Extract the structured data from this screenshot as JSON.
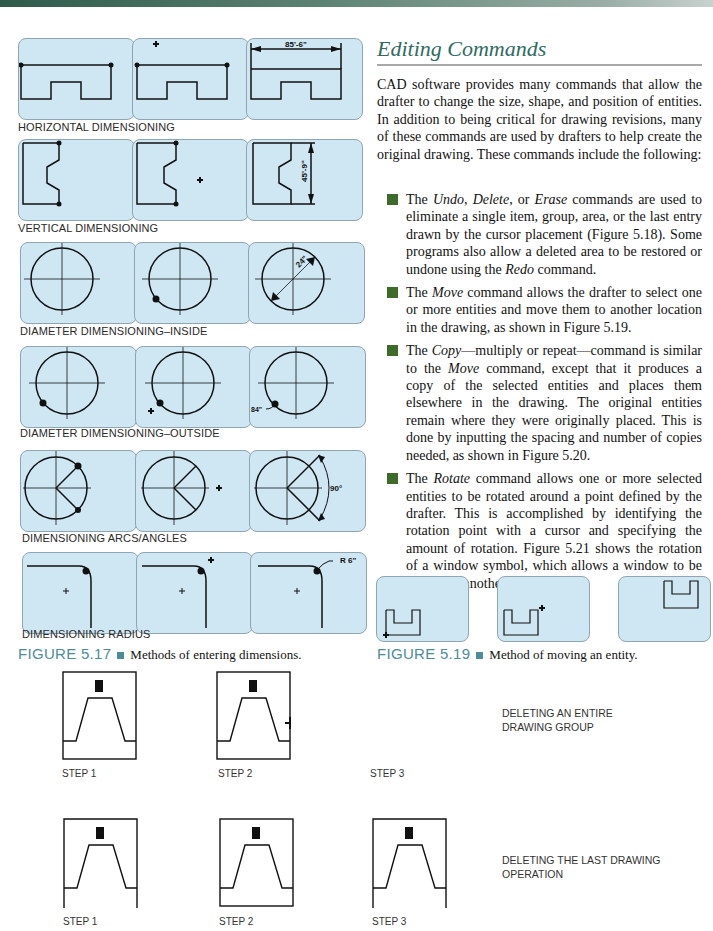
{
  "page": {
    "section_heading": "Editing Commands",
    "intro_paragraph": "CAD software provides many commands that allow the drafter to change the size, shape, and position of entities. In addition to being critical for drawing revisions, many of these commands are used by drafters to help create the original drawing. These commands include the following:",
    "bullets": [
      {
        "parts": [
          "The ",
          "Undo",
          ", ",
          "Delete",
          ", or ",
          "Erase",
          " commands are used to eliminate a single item, group, area, or the last entry drawn by the cursor placement (Figure 5.18). Some programs also allow a deleted area to be restored or undone using the ",
          "Redo",
          " command."
        ]
      },
      {
        "parts": [
          "The ",
          "Move",
          " command allows the drafter to select one or more entities and move them to another location in the drawing, as shown in Figure 5.19."
        ]
      },
      {
        "parts": [
          "The ",
          "Copy",
          "—multiply or repeat—command is similar to the ",
          "Move",
          " command, except that it produces a copy of the selected entities and places them elsewhere in the drawing. The original entities remain where they were originally placed. This is done by inputting the spacing and number of copies needed, as shown in Figure 5.20."
        ]
      },
      {
        "parts": [
          "The ",
          "Rotate",
          " command allows one or more selected entities to be rotated around a point defined by the drafter. This is accomplished by identifying the rotation point with a cursor and specifying the amount of rotation. Figure 5.21 shows the rotation of a window symbol, which allows a window to be placed on another wall."
        ]
      }
    ]
  },
  "figure_5_17": {
    "number": "FIGURE 5.17",
    "caption": "Methods of entering dimensions.",
    "rows": [
      {
        "label": "HORIZONTAL DIMENSIONING",
        "dimension_text": "85'-6\""
      },
      {
        "label": "VERTICAL DIMENSIONING",
        "dimension_text": "45'-9\""
      },
      {
        "label": "DIAMETER DIMENSIONING–INSIDE",
        "dimension_text": "24\""
      },
      {
        "label": "DIAMETER DIMENSIONING–OUTSIDE",
        "dimension_text": "84\""
      },
      {
        "label": "DIMENSIONING ARCS/ANGLES",
        "dimension_text": "90°"
      },
      {
        "label": "DIMENSIONING RADIUS",
        "dimension_text": "R 6\""
      }
    ]
  },
  "figure_5_19": {
    "number": "FIGURE 5.19",
    "caption": "Method of moving an entity."
  },
  "figure_5_18": {
    "rows": [
      {
        "steps": [
          "STEP 1",
          "STEP 2",
          "STEP 3"
        ],
        "description": "DELETING AN ENTIRE DRAWING GROUP"
      },
      {
        "steps": [
          "STEP 1",
          "STEP 2",
          "STEP 3"
        ],
        "description": "DELETING THE LAST DRAWING OPERATION"
      }
    ]
  },
  "colors": {
    "panel_fill": "#cfe6f3",
    "heading": "#2e6b62",
    "figure_number": "#4c8c98",
    "bullet": "#3d6b2a"
  }
}
